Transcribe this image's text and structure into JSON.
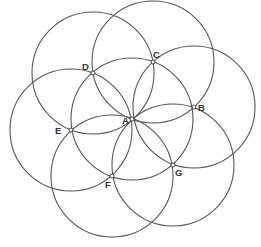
{
  "diagram": {
    "title": "",
    "type": "seven overlapping circles (flower of life construction)",
    "radius": 61,
    "stroke_color": "#555555",
    "background": "#ffffff",
    "points": [
      {
        "id": "A",
        "label": "A",
        "x": 132,
        "y": 119,
        "lx": 122,
        "ly": 124
      },
      {
        "id": "B",
        "label": "B",
        "x": 194,
        "y": 107,
        "lx": 198,
        "ly": 111
      },
      {
        "id": "C",
        "label": "C",
        "x": 153,
        "y": 62,
        "lx": 153,
        "ly": 58
      },
      {
        "id": "D",
        "label": "D",
        "x": 93,
        "y": 73,
        "lx": 82,
        "ly": 70
      },
      {
        "id": "E",
        "label": "E",
        "x": 71,
        "y": 130,
        "lx": 55,
        "ly": 134
      },
      {
        "id": "F",
        "label": "F",
        "x": 112,
        "y": 176,
        "lx": 105,
        "ly": 188
      },
      {
        "id": "G",
        "label": "G",
        "x": 173,
        "y": 165,
        "lx": 175,
        "ly": 176
      }
    ],
    "circles": [
      {
        "center": "A",
        "cx": 132,
        "cy": 119,
        "r": 61
      },
      {
        "center": "B",
        "cx": 194,
        "cy": 107,
        "r": 61
      },
      {
        "center": "C",
        "cx": 153,
        "cy": 62,
        "r": 61
      },
      {
        "center": "D",
        "cx": 93,
        "cy": 73,
        "r": 61
      },
      {
        "center": "E",
        "cx": 71,
        "cy": 130,
        "r": 61
      },
      {
        "center": "F",
        "cx": 112,
        "cy": 176,
        "r": 61
      },
      {
        "center": "G",
        "cx": 173,
        "cy": 165,
        "r": 61
      }
    ]
  }
}
